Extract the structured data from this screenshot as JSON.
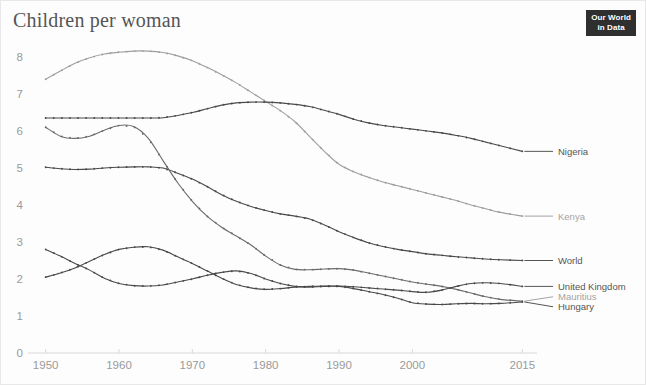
{
  "header": {
    "title": "Children per woman",
    "logo_line1": "Our World",
    "logo_line2": "in Data"
  },
  "colors": {
    "dark_line": "#4a4a4a",
    "mid_line": "#6b6b6b",
    "light_line": "#9e9e9e",
    "axis": "#d9d9d9",
    "tick_text": "#9a9a9a",
    "label_dark": "#555555",
    "label_light": "#a3a3a3",
    "logo_bg": "#2f2f2f",
    "background": "#ffffff"
  },
  "chart_data": {
    "type": "line",
    "title": "Children per woman",
    "xlabel": "",
    "ylabel": "",
    "xlim": [
      1948,
      2017
    ],
    "ylim": [
      0,
      8.6
    ],
    "grid": false,
    "legend_position": "right-inline",
    "x_ticks": [
      "1950",
      "1960",
      "1970",
      "1980",
      "1990",
      "2000",
      "2015"
    ],
    "x_tick_values": [
      1950,
      1960,
      1970,
      1980,
      1990,
      2000,
      2015
    ],
    "y_ticks": [
      "0",
      "1",
      "2",
      "3",
      "4",
      "5",
      "6",
      "7",
      "8"
    ],
    "y_tick_values": [
      0,
      1,
      2,
      3,
      4,
      5,
      6,
      7,
      8
    ],
    "x": [
      1950,
      1952,
      1954,
      1956,
      1958,
      1960,
      1962,
      1964,
      1966,
      1968,
      1970,
      1972,
      1974,
      1976,
      1978,
      1980,
      1982,
      1984,
      1986,
      1988,
      1990,
      1992,
      1994,
      1996,
      1998,
      2000,
      2002,
      2004,
      2006,
      2008,
      2010,
      2012,
      2015
    ],
    "series": [
      {
        "name": "Kenya",
        "color": "#9e9e9e",
        "label_color": "#a3a3a3",
        "values": [
          7.4,
          7.62,
          7.83,
          7.98,
          8.08,
          8.13,
          8.16,
          8.16,
          8.12,
          8.03,
          7.9,
          7.72,
          7.52,
          7.3,
          7.05,
          6.8,
          6.55,
          6.25,
          5.85,
          5.45,
          5.1,
          4.9,
          4.75,
          4.62,
          4.52,
          4.42,
          4.32,
          4.22,
          4.12,
          4.0,
          3.9,
          3.8,
          3.7
        ]
      },
      {
        "name": "Nigeria",
        "color": "#4a4a4a",
        "label_color": "#555555",
        "values": [
          6.35,
          6.35,
          6.35,
          6.35,
          6.35,
          6.35,
          6.35,
          6.35,
          6.36,
          6.42,
          6.5,
          6.6,
          6.7,
          6.76,
          6.78,
          6.78,
          6.76,
          6.72,
          6.66,
          6.56,
          6.45,
          6.32,
          6.22,
          6.15,
          6.1,
          6.05,
          6.0,
          5.95,
          5.88,
          5.8,
          5.7,
          5.6,
          5.45
        ]
      },
      {
        "name": "World",
        "color": "#4a4a4a",
        "label_color": "#555555",
        "values": [
          5.02,
          4.98,
          4.96,
          4.97,
          5.0,
          5.02,
          5.03,
          5.03,
          5.0,
          4.86,
          4.7,
          4.5,
          4.28,
          4.1,
          3.96,
          3.85,
          3.76,
          3.7,
          3.62,
          3.46,
          3.28,
          3.12,
          2.98,
          2.88,
          2.8,
          2.74,
          2.68,
          2.64,
          2.6,
          2.57,
          2.54,
          2.52,
          2.5
        ]
      },
      {
        "name": "Mauritius",
        "color": "#6b6b6b",
        "label_color": "#a3a3a3",
        "values": [
          6.1,
          5.86,
          5.8,
          5.86,
          6.02,
          6.15,
          6.12,
          5.8,
          5.2,
          4.6,
          4.1,
          3.7,
          3.4,
          3.16,
          2.92,
          2.62,
          2.38,
          2.26,
          2.25,
          2.27,
          2.28,
          2.24,
          2.16,
          2.08,
          2.0,
          1.92,
          1.86,
          1.8,
          1.72,
          1.62,
          1.52,
          1.45,
          1.4
        ]
      },
      {
        "name": "United Kingdom",
        "color": "#4a4a4a",
        "label_color": "#555555",
        "values": [
          2.05,
          2.16,
          2.3,
          2.48,
          2.66,
          2.8,
          2.86,
          2.87,
          2.78,
          2.6,
          2.42,
          2.22,
          2.02,
          1.85,
          1.76,
          1.72,
          1.74,
          1.78,
          1.8,
          1.81,
          1.81,
          1.79,
          1.76,
          1.73,
          1.7,
          1.66,
          1.64,
          1.7,
          1.8,
          1.88,
          1.9,
          1.88,
          1.8
        ]
      },
      {
        "name": "Hungary",
        "color": "#4a4a4a",
        "label_color": "#555555",
        "values": [
          2.8,
          2.62,
          2.42,
          2.24,
          2.02,
          1.88,
          1.82,
          1.81,
          1.84,
          1.92,
          2.0,
          2.1,
          2.18,
          2.22,
          2.15,
          2.0,
          1.88,
          1.8,
          1.78,
          1.8,
          1.8,
          1.74,
          1.66,
          1.58,
          1.48,
          1.36,
          1.32,
          1.31,
          1.33,
          1.34,
          1.33,
          1.34,
          1.38
        ]
      }
    ]
  },
  "series_labels": [
    {
      "name": "Nigeria",
      "y_value": 5.45
    },
    {
      "name": "Kenya",
      "y_value": 3.7
    },
    {
      "name": "World",
      "y_value": 2.5
    },
    {
      "name": "United Kingdom",
      "y_value": 1.8
    },
    {
      "name": "Mauritius",
      "y_value": 1.52
    },
    {
      "name": "Hungary",
      "y_value": 1.25
    }
  ]
}
